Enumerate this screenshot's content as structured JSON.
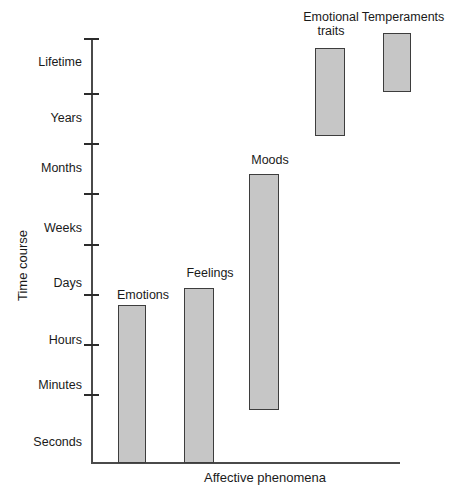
{
  "chart_data": {
    "type": "bar",
    "title": "",
    "subtitle": "",
    "xlabel": "Affective phenomena",
    "ylabel": "Time course",
    "grid": false,
    "legend": "none",
    "axis_note": "Y axis is an ordinal/logarithmic time-course scale; bars are floating ranges spanning a start and end time level.",
    "y_tick_labels": [
      "Lifetime",
      "Years",
      "Months",
      "Weeks",
      "Days",
      "Hours",
      "Minutes",
      "Seconds"
    ],
    "ylim": [
      "Seconds",
      "Lifetime"
    ],
    "categories": [
      "Emotions",
      "Feelings",
      "Moods",
      "Emotional traits",
      "Temperaments"
    ],
    "bars": [
      {
        "label": "Emotions",
        "range_low": "Seconds",
        "range_high": "Hours-Days",
        "y_top_px": 305,
        "y_bottom_px": 463,
        "x_left_px": 118,
        "x_right_px": 146
      },
      {
        "label": "Feelings",
        "range_low": "Seconds",
        "range_high": "Days",
        "y_top_px": 288,
        "y_bottom_px": 463,
        "x_left_px": 184,
        "x_right_px": 214
      },
      {
        "label": "Moods",
        "range_low": "Minutes",
        "range_high": "Months",
        "y_top_px": 174,
        "y_bottom_px": 410,
        "x_left_px": 249,
        "x_right_px": 279
      },
      {
        "label": "Emotional\ntraits",
        "range_low": "Years",
        "range_high": "Lifetime",
        "y_top_px": 48,
        "y_bottom_px": 136,
        "x_left_px": 315,
        "x_right_px": 345
      },
      {
        "label": "Temperaments",
        "range_low": "Lifetime",
        "range_high": "Lifetime",
        "y_top_px": 33,
        "y_bottom_px": 92,
        "x_left_px": 383,
        "x_right_px": 411
      }
    ],
    "colors": {
      "bar_fill": "#c6c6c6",
      "bar_stroke": "#3d3d3d",
      "axis": "#4a4a4a",
      "text": "#1a1a1a",
      "background": "#ffffff"
    }
  },
  "axis": {
    "y_title": "Time course",
    "x_title": "Affective phenomena",
    "ticks": [
      {
        "label": "Lifetime",
        "tick_y": 38,
        "label_y": 55
      },
      {
        "label": "Years",
        "tick_y": 93,
        "label_y": 111
      },
      {
        "label": "Months",
        "tick_y": 143,
        "label_y": 161
      },
      {
        "label": "Weeks",
        "tick_y": 193,
        "label_y": 221
      },
      {
        "label": "Days",
        "tick_y": 244,
        "label_y": 276
      },
      {
        "label": "Hours",
        "tick_y": 294,
        "label_y": 333
      },
      {
        "label": "Minutes",
        "tick_y": 344,
        "label_y": 378
      },
      {
        "label": "Seconds",
        "tick_y": 394,
        "label_y": 435
      }
    ]
  },
  "bar_labels": [
    {
      "text": "Emotions",
      "left": 106,
      "top": 288,
      "width": 74
    },
    {
      "text": "Feelings",
      "left": 173,
      "top": 266,
      "width": 74
    },
    {
      "text": "Moods",
      "left": 240,
      "top": 153,
      "width": 60
    },
    {
      "text": "Emotional\ntraits",
      "left": 299,
      "top": 10,
      "width": 64
    },
    {
      "text": "Temperaments",
      "left": 357,
      "top": 10,
      "width": 92
    }
  ]
}
